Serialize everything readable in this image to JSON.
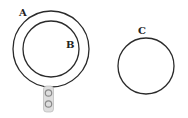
{
  "diagram": {
    "labels": {
      "a": "A",
      "b": "B",
      "c": "C"
    },
    "colors": {
      "stroke": "#2a2a2a",
      "connector_fill": "#d9d9d9",
      "connector_stroke": "#9a9a9a"
    },
    "circles": [
      {
        "name": "A",
        "cx": 51,
        "cy": 49,
        "r": 38
      },
      {
        "name": "B",
        "cx": 51,
        "cy": 49,
        "r": 28
      },
      {
        "name": "C",
        "cx": 146,
        "cy": 66,
        "r": 28
      }
    ]
  }
}
